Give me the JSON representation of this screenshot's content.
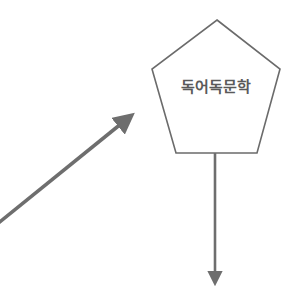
{
  "diagram": {
    "node": {
      "shape": "pentagon",
      "label": "독어독문학",
      "stroke_color": "#6b6b6b",
      "fill_color": "#ffffff",
      "text_color": "#5a5a5a"
    },
    "edges": [
      {
        "id": "incoming-diagonal-arrow",
        "direction": "into-node",
        "color": "#6e6e6e"
      },
      {
        "id": "outgoing-down-arrow",
        "direction": "out-of-node",
        "color": "#6e6e6e"
      }
    ]
  }
}
